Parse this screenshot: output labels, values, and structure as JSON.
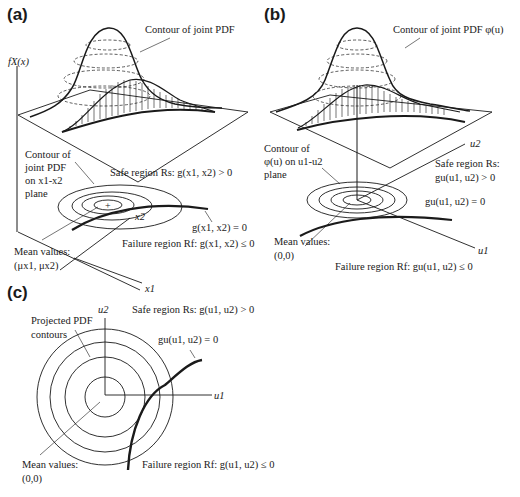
{
  "panels": {
    "a": {
      "tag": "(a)",
      "y_axis": "fX(x)",
      "x1_axis": "x1",
      "x2_axis": "x2",
      "contour_label": "Contour of joint PDF",
      "plane_contour_label": [
        "Contour of",
        "joint PDF",
        "on x1-x2",
        "plane"
      ],
      "safe_region": "Safe region Rs: g(x1, x2) > 0",
      "limit_state": "g(x1, x2) = 0",
      "failure_region": "Failure region Rf: g(x1, x2) ≤ 0",
      "mean_label": [
        "Mean values:",
        "(μx1, μx2)"
      ]
    },
    "b": {
      "tag": "(b)",
      "u1_axis": "u1",
      "u2_axis": "u2",
      "contour_label": "Contour of joint PDF φ(u)",
      "plane_contour_label": [
        "Contour of",
        "φ(u) on u1-u2",
        "plane"
      ],
      "safe_region": [
        "Safe region Rs:",
        "gu(u1, u2) > 0"
      ],
      "limit_state": "gu(u1, u2) = 0",
      "failure_region": "Failure region Rf: gu(u1, u2) ≤ 0",
      "mean_label": [
        "Mean values:",
        "(0,0)"
      ]
    },
    "c": {
      "tag": "(c)",
      "u1_axis": "u1",
      "u2_axis": "u2",
      "projected_label": [
        "Projected PDF",
        "contours"
      ],
      "safe_region": "Safe region Rs: g(u1, u2) > 0",
      "limit_state": "gu(u1, u2) = 0",
      "failure_region": "Failure region Rf: g(u1, u2) ≤ 0",
      "mean_label": [
        "Mean values:",
        "(0,0)"
      ]
    }
  },
  "colors": {
    "ink": "#1a1a1a",
    "background": "#ffffff"
  }
}
